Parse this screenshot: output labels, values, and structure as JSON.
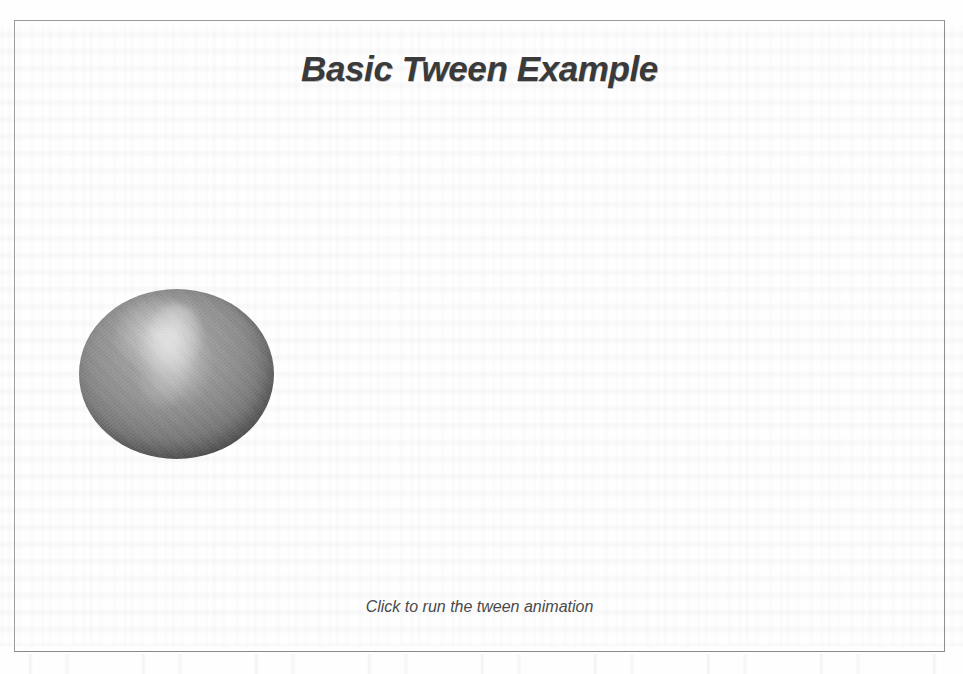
{
  "page": {
    "background_color": "#fefefe",
    "frame_border_color": "#9c9c9c"
  },
  "applet": {
    "title": "Basic Tween Example",
    "title_color": "#3a3a3a",
    "caption": "Click to run the tween animation",
    "caption_color": "#4a4a4a",
    "sphere": {
      "name": "tween-sphere",
      "fill_color": "#8a8a8a",
      "edge_color": "#4a4a4a",
      "highlight_color": "#ffffff"
    }
  }
}
